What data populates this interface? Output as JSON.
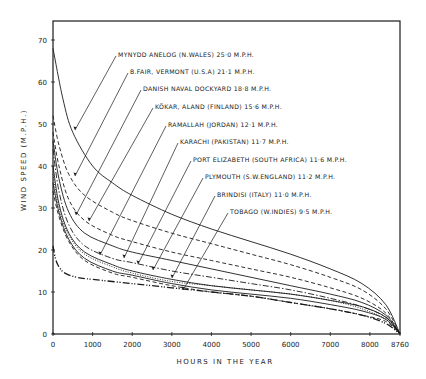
{
  "chart_data": {
    "type": "line",
    "title": "",
    "xlabel": "HOURS IN THE YEAR",
    "ylabel": "WIND SPEED (M.P.H.)",
    "xlim": [
      0,
      8760
    ],
    "ylim": [
      0,
      75
    ],
    "x_ticks": [
      0,
      1000,
      2000,
      3000,
      4000,
      5000,
      6000,
      7000,
      8000,
      8760
    ],
    "x_tick_labels": [
      "0",
      "1000",
      "2000",
      "3000",
      "4000",
      "5000",
      "6000",
      "7000",
      "8000",
      "8760"
    ],
    "y_ticks": [
      0,
      10,
      20,
      30,
      40,
      50,
      60,
      70
    ],
    "y_tick_labels": [
      "0",
      "10",
      "20",
      "30",
      "40",
      "50",
      "60",
      "70"
    ],
    "grid": false,
    "legend_position": "inline annotations with leader lines",
    "series": [
      {
        "name": "MYNYDD ANELOG (N.WALES) 25·0 M.P.H.",
        "style": "solid",
        "x": [
          0,
          250,
          500,
          1000,
          1500,
          2000,
          3000,
          4000,
          5000,
          6000,
          7000,
          7800,
          8400,
          8760
        ],
        "y": [
          68,
          56,
          48,
          40,
          36,
          33,
          28.5,
          25,
          22,
          19,
          15.5,
          12,
          7,
          0
        ]
      },
      {
        "name": "B.FAIR, VERMONT (U.S.A) 21·1 M.P.H.",
        "style": "dashed",
        "x": [
          0,
          150,
          400,
          800,
          1500,
          2000,
          3000,
          4000,
          5000,
          6000,
          7000,
          7800,
          8400,
          8760
        ],
        "y": [
          52,
          45,
          38,
          33,
          29,
          27,
          24,
          21.5,
          19,
          16.5,
          13.5,
          10.5,
          6,
          0
        ]
      },
      {
        "name": "DANISH NAVAL DOCKYARD 18·8 M.P.H.",
        "style": "dashed",
        "x": [
          0,
          150,
          400,
          800,
          1500,
          2000,
          3000,
          4000,
          5000,
          6000,
          7000,
          7800,
          8400,
          8760
        ],
        "y": [
          48,
          40,
          32,
          27,
          23.5,
          22,
          19.5,
          17.5,
          15.5,
          13.5,
          11,
          8.5,
          5,
          0
        ]
      },
      {
        "name": "KÖKAR, ALAND (FINLAND) 15·6 M.P.H.",
        "style": "solid",
        "x": [
          0,
          150,
          400,
          800,
          1500,
          2000,
          3000,
          4000,
          5000,
          6000,
          7000,
          7800,
          8400,
          8760
        ],
        "y": [
          46,
          37,
          29,
          24,
          21,
          19.5,
          17.5,
          15.5,
          13.5,
          11.5,
          9.5,
          7.5,
          4.5,
          0
        ]
      },
      {
        "name": "RAMALLAH (JORDAN) 12·1 M.P.H.",
        "style": "dashdot",
        "x": [
          0,
          150,
          400,
          800,
          1500,
          2000,
          3000,
          4000,
          5000,
          6000,
          7000,
          7800,
          8400,
          8760
        ],
        "y": [
          44,
          34,
          26,
          21,
          18,
          17,
          15,
          13.5,
          12,
          10.5,
          8.5,
          6.5,
          4,
          0
        ]
      },
      {
        "name": "KARACHI (PAKISTAN) 11·7 M.P.H.",
        "style": "solid",
        "x": [
          0,
          150,
          400,
          800,
          1500,
          2000,
          3000,
          4000,
          5000,
          6000,
          7000,
          7800,
          8400,
          8760
        ],
        "y": [
          40,
          31,
          24,
          19.5,
          16.5,
          15,
          13,
          11.5,
          10.5,
          9.5,
          8,
          6.5,
          4,
          0
        ]
      },
      {
        "name": "PORT ELIZABETH (SOUTH AFRICA) 11·6 M.P.H.",
        "style": "dotted",
        "x": [
          0,
          150,
          400,
          800,
          1500,
          2000,
          3000,
          4000,
          5000,
          6000,
          7000,
          7800,
          8400,
          8760
        ],
        "y": [
          38,
          30,
          23.5,
          19,
          16,
          14.5,
          12.5,
          11.5,
          10.5,
          9.5,
          8,
          6,
          3.5,
          0
        ]
      },
      {
        "name": "PLYMOUTH (S.W.ENGLAND) 11·2 M.P.H.",
        "style": "solid",
        "x": [
          0,
          150,
          400,
          800,
          1500,
          2000,
          3000,
          4000,
          5000,
          6000,
          7000,
          7800,
          8400,
          8760
        ],
        "y": [
          36,
          29,
          22.5,
          18,
          15,
          14,
          12,
          10.5,
          9.5,
          8.5,
          7,
          5.5,
          3.5,
          0
        ]
      },
      {
        "name": "BRINDISI (ITALY) 11·0 M.P.H.",
        "style": "dashed",
        "x": [
          0,
          150,
          400,
          800,
          1500,
          2000,
          3000,
          4000,
          5000,
          6000,
          7000,
          7800,
          8400,
          8760
        ],
        "y": [
          34,
          28,
          22,
          17.5,
          14.5,
          13.5,
          11.5,
          10,
          9,
          7.5,
          6,
          4.5,
          3,
          0
        ]
      },
      {
        "name": "TOBAGO (W.INDIES) 9·5 M.P.H.",
        "style": "dashdotdot",
        "x": [
          0,
          60,
          150,
          300,
          600,
          1000,
          2000,
          3000,
          4000,
          5000,
          6000,
          7000,
          7800,
          8400,
          8760
        ],
        "y": [
          21,
          18,
          16,
          14.5,
          13.5,
          13,
          12,
          11,
          10,
          9,
          7.5,
          6,
          4.5,
          2.5,
          0
        ]
      }
    ],
    "annotations": [
      {
        "text": "MYNYDD ANELOG (N.WALES) 25·0 M.P.H.",
        "label_xy": [
          118,
          55
        ],
        "target_xy": [
          75,
          130
        ]
      },
      {
        "text": "B.FAIR, VERMONT (U.S.A) 21·1 M.P.H.",
        "label_xy": [
          130,
          72
        ],
        "target_xy": [
          75,
          176
        ]
      },
      {
        "text": "DANISH NAVAL DOCKYARD 18·8 M.P.H.",
        "label_xy": [
          143,
          89
        ],
        "target_xy": [
          76,
          215
        ]
      },
      {
        "text": "KÖKAR, ALAND (FINLAND) 15·6 M.P.H.",
        "label_xy": [
          155,
          107
        ],
        "target_xy": [
          89,
          221
        ]
      },
      {
        "text": "RAMALLAH (JORDAN) 12·1 M.P.H.",
        "label_xy": [
          168,
          125
        ],
        "target_xy": [
          100,
          255
        ]
      },
      {
        "text": "KARACHI (PAKISTAN) 11·7 M.P.H.",
        "label_xy": [
          180,
          142
        ],
        "target_xy": [
          124,
          258
        ]
      },
      {
        "text": "PORT ELIZABETH (SOUTH AFRICA) 11·6 M.P.H.",
        "label_xy": [
          193,
          160
        ],
        "target_xy": [
          138,
          264
        ]
      },
      {
        "text": "PLYMOUTH (S.W.ENGLAND) 11·2 M.P.H.",
        "label_xy": [
          205,
          177
        ],
        "target_xy": [
          153,
          270
        ]
      },
      {
        "text": "BRINDISI (ITALY) 11·0 M.P.H.",
        "label_xy": [
          217,
          195
        ],
        "target_xy": [
          172,
          278
        ]
      },
      {
        "text": "TOBAGO (W.INDIES) 9·5 M.P.H.",
        "label_xy": [
          230,
          212
        ],
        "target_xy": [
          183,
          290
        ]
      }
    ]
  },
  "colors": {
    "ink": "#1a1a1a",
    "background": "#ffffff"
  }
}
